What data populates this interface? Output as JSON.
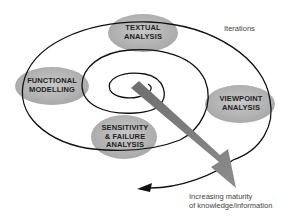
{
  "diagram": {
    "type": "spiral",
    "nodes": [
      {
        "id": "textual",
        "line1": "TEXTUAL",
        "line2": "ANALYSIS"
      },
      {
        "id": "functional",
        "line1": "FUNCTIONAL",
        "line2": "MODELLING"
      },
      {
        "id": "viewpoint",
        "line1": "VIEWPOINT",
        "line2": "ANALYSIS"
      },
      {
        "id": "sensitivity",
        "line1": "SENSITIVITY",
        "line2": "& FAILURE",
        "line3": "ANALYSIS"
      }
    ],
    "annotations": {
      "iterations": "Iterations",
      "maturity_line1": "Increasing maturity",
      "maturity_line2": "of knowledge/information"
    },
    "colors": {
      "ellipse_fill": "#b4b4b4",
      "spiral_stroke": "#111111",
      "arrow_fill": "#7a7a7a"
    }
  }
}
